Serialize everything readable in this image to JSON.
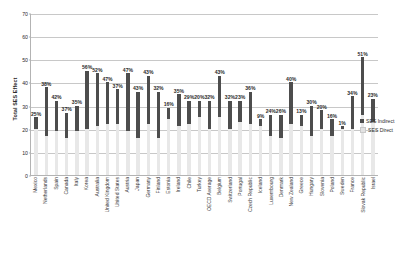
{
  "chart_data": {
    "type": "bar",
    "title": "",
    "xlabel": "",
    "ylabel": "Total SES Effect",
    "ylim": [
      0,
      70
    ],
    "yticks": [
      0,
      10,
      20,
      30,
      40,
      50,
      60,
      70
    ],
    "grid": true,
    "stacked": true,
    "legend_position": "right",
    "categories": [
      "Mexico",
      "Netherlands",
      "Spain",
      "Canada",
      "Italy",
      "Korea",
      "Australia",
      "United Kingdom",
      "United States",
      "Austria",
      "Japan",
      "Germany",
      "Finland",
      "Estonia",
      "Ireland",
      "Chile",
      "Turkey",
      "OECD Average",
      "Belgium",
      "Switzerland",
      "Portugal",
      "Czech Republic",
      "Iceland",
      "Luxembourg",
      "Denmark",
      "New Zealand",
      "Greece",
      "Hungary",
      "Slovenia",
      "Poland",
      "Sweden",
      "France",
      "Slovak Republic",
      "Israel"
    ],
    "series": [
      {
        "name": "SES Indirect",
        "color": "#4d4d4d",
        "values": [
          5,
          21,
          13,
          11,
          11,
          25,
          23,
          18,
          15,
          25,
          20,
          21,
          20,
          5,
          14,
          10,
          7,
          12,
          18,
          12,
          9,
          14,
          3,
          9,
          10,
          18,
          5,
          13,
          8,
          7,
          1,
          14,
          25,
          10
        ]
      },
      {
        "name": "SES Direct",
        "color": "#e8e8e8",
        "values": [
          20,
          17,
          19,
          16,
          19,
          20,
          21,
          22,
          22,
          19,
          16,
          22,
          16,
          24,
          21,
          22,
          25,
          20,
          25,
          20,
          23,
          22,
          21,
          17,
          16,
          22,
          21,
          17,
          20,
          17,
          20,
          20,
          26,
          23
        ]
      }
    ],
    "data_labels": [
      "25%",
      "38%",
      "42%",
      "37%",
      "35%",
      "56%",
      "52%",
      "47%",
      "37%",
      "47%",
      "43%",
      "43%",
      "32%",
      "16%",
      "35%",
      "29%",
      "20%",
      "32%",
      "43%",
      "32%",
      "23%",
      "36%",
      "9%",
      "24%",
      "26%",
      "40%",
      "13%",
      "30%",
      "20%",
      "16%",
      "1%",
      "34%",
      "51%",
      "23%"
    ],
    "totals": [
      25,
      38,
      42,
      37,
      35,
      56,
      52,
      47,
      37,
      47,
      43,
      43,
      32,
      16,
      35,
      29,
      20,
      32,
      43,
      32,
      23,
      36,
      9,
      24,
      26,
      40,
      13,
      30,
      20,
      16,
      1,
      34,
      51,
      23
    ]
  },
  "legend": {
    "items": [
      {
        "label": "SES Indirect"
      },
      {
        "label": "SES Direct"
      }
    ]
  }
}
